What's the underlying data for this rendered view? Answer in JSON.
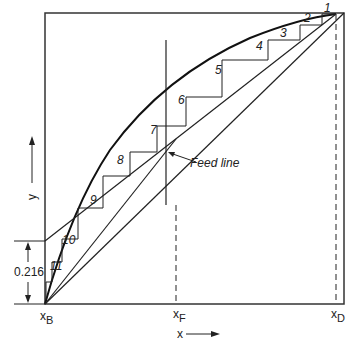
{
  "figure": {
    "type": "McCabe-Thiele distillation diagram",
    "axis_x_label": "x",
    "axis_y_label": "y",
    "tick_labels": {
      "x_B": {
        "main": "x",
        "sub": "B"
      },
      "x_F": {
        "main": "x",
        "sub": "F"
      },
      "x_D": {
        "main": "x",
        "sub": "D"
      }
    },
    "intercept_label": "0.216",
    "feed_line_label": "Feed line",
    "stage_labels": [
      "1",
      "2",
      "3",
      "4",
      "5",
      "6",
      "7",
      "8",
      "9",
      "10",
      "11"
    ]
  },
  "colors": {
    "line": "#222222",
    "background": "#ffffff"
  }
}
